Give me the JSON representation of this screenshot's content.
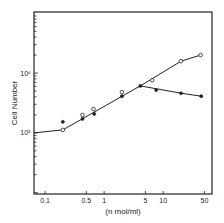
{
  "chart_data": {
    "type": "line",
    "title": "",
    "xlabel": "(n mol/ml)",
    "ylabel": "Cell Number",
    "xscale": "log",
    "yscale": "log",
    "xlim": [
      0.065,
      67
    ],
    "ylim": [
      9500,
      10500000
    ],
    "grid": false,
    "legend": "none",
    "x_ticks": [
      {
        "value": 0.1,
        "label": "0.1"
      },
      {
        "value": 0.5,
        "label": "0.5"
      },
      {
        "value": 1,
        "label": "1"
      },
      {
        "value": 5,
        "label": "5"
      },
      {
        "value": 10,
        "label": "10"
      },
      {
        "value": 50,
        "label": "50"
      }
    ],
    "y_ticks": [
      {
        "value": 100000,
        "label": "10⁵"
      },
      {
        "value": 1000000,
        "label": "10⁶"
      }
    ],
    "series": [
      {
        "name": "open-circles",
        "marker": "open-circle",
        "points": [
          {
            "x": 0.2,
            "y": 112000
          },
          {
            "x": 0.43,
            "y": 199000
          },
          {
            "x": 0.66,
            "y": 250000
          },
          {
            "x": 2.0,
            "y": 480000
          },
          {
            "x": 6.5,
            "y": 760000
          },
          {
            "x": 20,
            "y": 1580000
          },
          {
            "x": 43,
            "y": 2000000
          }
        ]
      },
      {
        "name": "filled-circles",
        "marker": "filled-circle",
        "points": [
          {
            "x": 0.2,
            "y": 153000
          },
          {
            "x": 0.43,
            "y": 171000
          },
          {
            "x": 0.68,
            "y": 207000
          },
          {
            "x": 2.0,
            "y": 410000
          },
          {
            "x": 4.1,
            "y": 610000
          },
          {
            "x": 7.6,
            "y": 520000
          },
          {
            "x": 20,
            "y": 460000
          },
          {
            "x": 44,
            "y": 410000
          }
        ]
      }
    ],
    "fitted_lines": [
      {
        "name": "common-and-open-fit",
        "points": [
          {
            "x": 0.065,
            "y": 100000
          },
          {
            "x": 0.2,
            "y": 112000
          },
          {
            "x": 4.1,
            "y": 610000
          },
          {
            "x": 20,
            "y": 1580000
          },
          {
            "x": 43,
            "y": 2000000
          }
        ]
      },
      {
        "name": "filled-fit",
        "points": [
          {
            "x": 4.1,
            "y": 610000
          },
          {
            "x": 20,
            "y": 460000
          },
          {
            "x": 44,
            "y": 410000
          }
        ]
      }
    ]
  }
}
